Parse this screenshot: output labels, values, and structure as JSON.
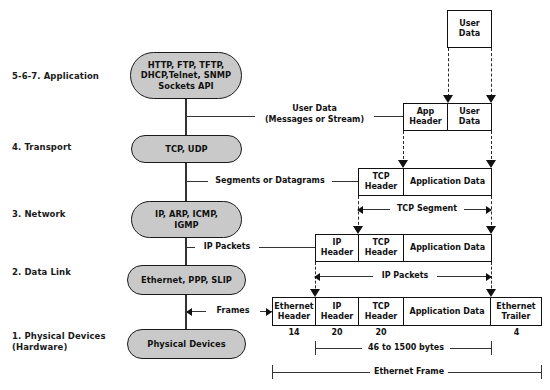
{
  "layers": [
    {
      "label": "5-6-7. Application",
      "box": "HTTP, FTP, TFTP,\nDHCP,Telnet, SNMP\nSockets API"
    },
    {
      "label": "4. Transport",
      "box": "TCP, UDP"
    },
    {
      "label": "3. Network",
      "box": "IP, ARP, ICMP,\nIGMP"
    },
    {
      "label": "2. Data Link",
      "box": "Ethernet, PPP, SLIP"
    },
    {
      "label": "1. Physical Devices\n(Hardware)",
      "box": "Physical Devices"
    }
  ],
  "flow_labels": {
    "user_data": "User Data\n(Messages or Stream)",
    "segments": "Segments or Datagrams",
    "ip_packets": "IP Packets",
    "frames": "Frames"
  },
  "pdu_rows": {
    "top_user_data": {
      "cells": [
        "User\nData"
      ]
    },
    "application": {
      "cells": [
        "App\nHeader",
        "User\nData"
      ]
    },
    "transport": {
      "cells": [
        "TCP\nHeader",
        "Application Data"
      ]
    },
    "network": {
      "cells": [
        "IP\nHeader",
        "TCP\nHeader",
        "Application Data"
      ]
    },
    "datalink": {
      "cells": [
        "Ethernet\nHeader",
        "IP\nHeader",
        "TCP\nHeader",
        "Application Data",
        "Ethernet\nTrailer"
      ]
    }
  },
  "byte_sizes": [
    "14",
    "20",
    "20",
    "4"
  ],
  "brackets": {
    "tcp_segment": "TCP Segment",
    "ip_packets": "IP Packets",
    "payload_range": "46 to 1500 bytes",
    "ethernet_frame": "Ethernet Frame"
  },
  "colors": {
    "stadium_fill": "#c9c9c9",
    "stroke": "#111111",
    "background": "#ffffff"
  }
}
